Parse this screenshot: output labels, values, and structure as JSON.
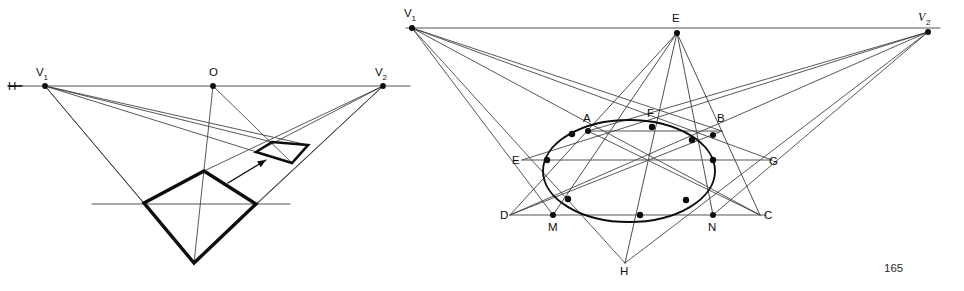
{
  "page": {
    "width": 964,
    "height": 291,
    "background": "#ffffff",
    "page_number": "165",
    "ink_color": "#0d0d0d",
    "thin_line_color": "#3a3a3a",
    "horizon_color": "#555555"
  },
  "figure_left": {
    "name": "two-point-perspective-plane-construction",
    "horizon": {
      "y": 86,
      "x_start": 10,
      "x_end": 410,
      "label_H": "H"
    },
    "points": [
      {
        "id": "H",
        "label": "H",
        "x": 14,
        "y": 86,
        "label_x": 8,
        "label_y": 90,
        "dot": false
      },
      {
        "id": "V1",
        "label": "V",
        "sub": "1",
        "x": 45,
        "y": 86,
        "label_x": 36,
        "label_y": 76,
        "dot": true
      },
      {
        "id": "O",
        "label": "O",
        "x": 213,
        "y": 86,
        "label_x": 209,
        "label_y": 76,
        "dot": true
      },
      {
        "id": "V2",
        "label": "V",
        "sub": "2",
        "x": 383,
        "y": 86,
        "label_x": 375,
        "label_y": 76,
        "dot": true
      }
    ],
    "ground_line": {
      "y": 204,
      "x_start": 92,
      "x_end": 290
    },
    "big_quad": [
      {
        "x": 144,
        "y": 203
      },
      {
        "x": 204,
        "y": 171
      },
      {
        "x": 256,
        "y": 204
      },
      {
        "x": 194,
        "y": 263
      }
    ],
    "small_quad": [
      {
        "x": 256,
        "y": 152
      },
      {
        "x": 272,
        "y": 142
      },
      {
        "x": 308,
        "y": 145
      },
      {
        "x": 292,
        "y": 163
      }
    ],
    "arrow": {
      "x1": 228,
      "y1": 183,
      "x2": 266,
      "y2": 160
    },
    "rays_from_V1": [
      {
        "x": 144,
        "y": 203
      },
      {
        "x": 194,
        "y": 263
      },
      {
        "x": 272,
        "y": 142
      },
      {
        "x": 308,
        "y": 145
      },
      {
        "x": 292,
        "y": 163
      }
    ],
    "rays_from_V2": [
      {
        "x": 256,
        "y": 204
      },
      {
        "x": 194,
        "y": 263
      },
      {
        "x": 256,
        "y": 152
      },
      {
        "x": 204,
        "y": 171
      }
    ],
    "rays_from_O": [
      {
        "x": 194,
        "y": 263
      },
      {
        "x": 292,
        "y": 163
      }
    ]
  },
  "figure_right": {
    "name": "perspective-circle-in-square-construction",
    "horizon": {
      "y": 28,
      "x_start": 406,
      "x_end": 940,
      "color": "#555555"
    },
    "points": [
      {
        "id": "V1",
        "label": "V",
        "sub": "1",
        "x": 412,
        "y": 28,
        "label_x": 404,
        "label_y": 17,
        "dot": true,
        "italic": false
      },
      {
        "id": "E_top",
        "label": "E",
        "x": 677,
        "y": 33,
        "label_x": 672,
        "label_y": 22,
        "dot": true,
        "italic": false
      },
      {
        "id": "V2",
        "label": "V",
        "sub": "2",
        "x": 928,
        "y": 32,
        "label_x": 918,
        "label_y": 21,
        "dot": true,
        "italic": true
      },
      {
        "id": "A",
        "label": "A",
        "x": 588,
        "y": 131,
        "label_x": 583,
        "label_y": 122,
        "dot": true
      },
      {
        "id": "F",
        "label": "F",
        "x": 652,
        "y": 127,
        "label_x": 647,
        "label_y": 117,
        "dot": true
      },
      {
        "id": "B",
        "label": "B",
        "x": 713,
        "y": 135,
        "label_x": 717,
        "label_y": 122,
        "dot": true
      },
      {
        "id": "E_left",
        "label": "E",
        "x": 522,
        "y": 160,
        "label_x": 512,
        "label_y": 164,
        "dot": false
      },
      {
        "id": "G",
        "label": "G",
        "x": 765,
        "y": 160,
        "label_x": 769,
        "label_y": 165,
        "dot": false
      },
      {
        "id": "D",
        "label": "D",
        "x": 510,
        "y": 215,
        "label_x": 500,
        "label_y": 219,
        "dot": false
      },
      {
        "id": "C",
        "label": "C",
        "x": 760,
        "y": 215,
        "label_x": 764,
        "label_y": 219,
        "dot": false
      },
      {
        "id": "M",
        "label": "M",
        "x": 553,
        "y": 215,
        "label_x": 548,
        "label_y": 231,
        "dot": true
      },
      {
        "id": "N",
        "label": "N",
        "x": 713,
        "y": 215,
        "label_x": 708,
        "label_y": 231,
        "dot": true
      },
      {
        "id": "H",
        "label": "H",
        "x": 625,
        "y": 263,
        "label_x": 620,
        "label_y": 275,
        "dot": false
      }
    ],
    "ellipse": {
      "cx": 629,
      "cy": 171,
      "rx": 86,
      "ry": 51
    },
    "ellipse_touch_points": [
      {
        "x": 572,
        "y": 134
      },
      {
        "x": 652,
        "y": 127
      },
      {
        "x": 692,
        "y": 140
      },
      {
        "x": 713,
        "y": 160
      },
      {
        "x": 686,
        "y": 200
      },
      {
        "x": 640,
        "y": 215
      },
      {
        "x": 568,
        "y": 199
      },
      {
        "x": 547,
        "y": 160
      }
    ],
    "chords": [
      {
        "name": "chord-AB",
        "x1": 588,
        "y1": 131,
        "x2": 722,
        "y2": 131
      },
      {
        "name": "chord-EG",
        "x1": 522,
        "y1": 160,
        "x2": 772,
        "y2": 160
      },
      {
        "name": "chord-DC",
        "x1": 510,
        "y1": 215,
        "x2": 766,
        "y2": 215
      }
    ],
    "rays_from_V1": [
      {
        "x": 722,
        "y": 131
      },
      {
        "x": 772,
        "y": 160
      },
      {
        "x": 760,
        "y": 215
      },
      {
        "x": 625,
        "y": 263
      },
      {
        "x": 553,
        "y": 215
      }
    ],
    "rays_from_V2": [
      {
        "x": 588,
        "y": 131
      },
      {
        "x": 522,
        "y": 160
      },
      {
        "x": 510,
        "y": 215
      },
      {
        "x": 625,
        "y": 263
      },
      {
        "x": 713,
        "y": 215
      }
    ],
    "rays_from_E_top": [
      {
        "x": 510,
        "y": 215
      },
      {
        "x": 553,
        "y": 215
      },
      {
        "x": 625,
        "y": 263
      },
      {
        "x": 713,
        "y": 215
      },
      {
        "x": 760,
        "y": 215
      }
    ],
    "diagonals": [
      {
        "name": "diagonal-D-B",
        "x1": 510,
        "y1": 215,
        "x2": 722,
        "y2": 131
      },
      {
        "name": "diagonal-C-A",
        "x1": 760,
        "y1": 215,
        "x2": 588,
        "y2": 131
      }
    ]
  }
}
